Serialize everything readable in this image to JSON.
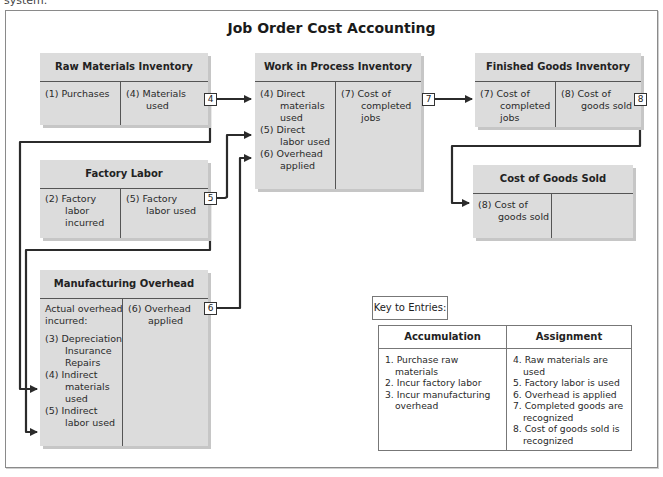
{
  "top_cut_text": "system.",
  "title": "Job Order Cost Accounting",
  "accounts": {
    "raw_materials": {
      "title": "Raw Materials Inventory",
      "debit": [
        "(1) Purchases"
      ],
      "credit": [
        "(4) Materials",
        "used"
      ]
    },
    "wip": {
      "title": "Work in Process Inventory",
      "debit": [
        {
          "line": "(4) Direct",
          "cont": [
            "materials",
            "used"
          ]
        },
        {
          "line": "(5) Direct",
          "cont": [
            "labor used"
          ]
        },
        {
          "line": "(6) Overhead",
          "cont": [
            "applied"
          ]
        }
      ],
      "credit": [
        "(7) Cost of",
        "completed",
        "jobs"
      ]
    },
    "finished_goods": {
      "title": "Finished Goods Inventory",
      "debit": [
        "(7) Cost of",
        "completed",
        "jobs"
      ],
      "credit": [
        "(8) Cost of",
        "goods sold"
      ]
    },
    "factory_labor": {
      "title": "Factory Labor",
      "debit": [
        "(2) Factory",
        "labor",
        "incurred"
      ],
      "credit": [
        "(5) Factory",
        "labor used"
      ]
    },
    "cogs": {
      "title": "Cost of Goods Sold",
      "debit": [
        "(8) Cost of",
        "goods sold"
      ],
      "credit": []
    },
    "overhead": {
      "title": "Manufacturing Overhead",
      "debit_intro": [
        "Actual overhead",
        "incurred:"
      ],
      "debit": [
        {
          "line": "(3) Depreciation",
          "cont": [
            "Insurance",
            "Repairs"
          ]
        },
        {
          "line": "(4) Indirect",
          "cont": [
            "materials",
            "used"
          ]
        },
        {
          "line": "(5) Indirect",
          "cont": [
            "labor used"
          ]
        }
      ],
      "credit": [
        "(6) Overhead",
        "applied"
      ]
    }
  },
  "tags": {
    "t4": "4",
    "t5": "5",
    "t6": "6",
    "t7": "7",
    "t8": "8"
  },
  "key": {
    "label": "Key to Entries:",
    "accumulation": {
      "header": "Accumulation",
      "items": [
        "1. Purchase raw materials",
        "2. Incur factory labor",
        "3. Incur manufacturing overhead"
      ]
    },
    "assignment": {
      "header": "Assignment",
      "items": [
        "4. Raw materials are used",
        "5. Factory labor is used",
        "6. Overhead is applied",
        "7. Completed goods are recognized",
        "8. Cost of goods sold is recognized"
      ]
    }
  },
  "colors": {
    "account_fill": "#dcdcdc",
    "line": "#2b2b2b",
    "frame": "#8a8a8a"
  }
}
